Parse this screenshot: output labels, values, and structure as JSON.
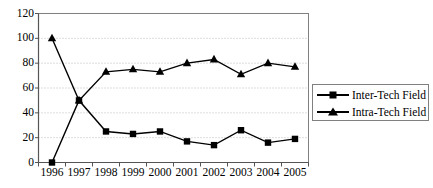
{
  "chart_data": {
    "type": "line",
    "title": "",
    "subtitle": "",
    "xlabel": "",
    "ylabel": "",
    "categories": [
      "1996",
      "1997",
      "1998",
      "1999",
      "2000",
      "2001",
      "2002",
      "2003",
      "2004",
      "2005"
    ],
    "series": [
      {
        "name": "Inter-Tech Field",
        "marker": "square",
        "color": "#000000",
        "values": [
          0,
          50,
          25,
          23,
          25,
          17,
          14,
          26,
          16,
          19
        ]
      },
      {
        "name": "Intra-Tech Field",
        "marker": "triangle",
        "color": "#000000",
        "values": [
          100,
          50,
          73,
          75,
          73,
          80,
          83,
          71,
          80,
          77
        ]
      }
    ],
    "ylim": [
      0,
      120
    ],
    "yticks": [
      0,
      20,
      40,
      60,
      80,
      100,
      120
    ],
    "ytick_labels": [
      "0",
      "20",
      "40",
      "60",
      "80",
      "100",
      "120"
    ],
    "grid": true,
    "grid_axis": "y",
    "grid_style": "dotted",
    "legend_position": "right-middle",
    "legend_entries": [
      "Inter-Tech Field",
      "Intra-Tech Field"
    ],
    "plot_border": true,
    "colors": {
      "line": "#000000",
      "marker": "#000000",
      "grid": "#b4b4b4",
      "axis": "#808080",
      "legend_border": "#808080",
      "background": "#ffffff"
    }
  }
}
